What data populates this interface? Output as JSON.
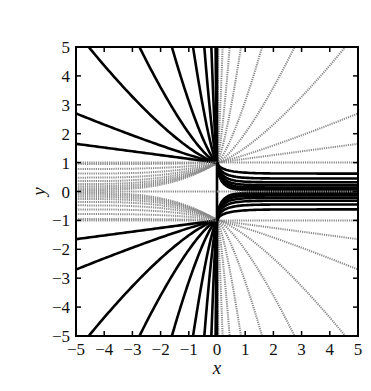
{
  "chart_data": {
    "type": "line",
    "title": "",
    "xlabel": "x",
    "ylabel": "y",
    "xlim": [
      -5,
      5
    ],
    "ylim": [
      -5,
      5
    ],
    "grid": false,
    "legend": null,
    "x_ticks": [
      "−5",
      "−4",
      "−3",
      "−2",
      "−1",
      "0",
      "1",
      "2",
      "3",
      "4",
      "5"
    ],
    "y_ticks": [
      "5",
      "4",
      "3",
      "2",
      "1",
      "0",
      "−1",
      "−2",
      "−3",
      "−4",
      "−5"
    ],
    "x_tick_values": [
      -5,
      -4,
      -3,
      -2,
      -1,
      0,
      1,
      2,
      3,
      4,
      5
    ],
    "y_tick_values": [
      5,
      4,
      3,
      2,
      1,
      0,
      -1,
      -2,
      -3,
      -4,
      -5
    ],
    "styles": {
      "solid": {
        "color": "#000000",
        "width": 2.6
      },
      "dotted": {
        "color": "#8a8a8a",
        "width": 2.0,
        "dash": "1.2 1.0"
      }
    },
    "series": [
      {
        "name": "upper-left fan (solid)",
        "style": "solid",
        "anchor": [
          0,
          1
        ],
        "side": "left",
        "dir": 1,
        "end_points": [
          [
            -5,
            1.65
          ],
          [
            -5,
            2.7
          ],
          [
            -4.55,
            5
          ],
          [
            -2.75,
            5
          ],
          [
            -1.6,
            5
          ],
          [
            -0.85,
            5
          ],
          [
            -0.45,
            5
          ],
          [
            -0.2,
            5
          ],
          [
            -0.05,
            5
          ]
        ]
      },
      {
        "name": "lower-left fan (solid)",
        "style": "solid",
        "anchor": [
          0,
          -1
        ],
        "side": "left",
        "dir": -1,
        "end_points": [
          [
            -5,
            -1.65
          ],
          [
            -5,
            -2.7
          ],
          [
            -4.55,
            -5
          ],
          [
            -2.75,
            -5
          ],
          [
            -1.6,
            -5
          ],
          [
            -0.85,
            -5
          ],
          [
            -0.45,
            -5
          ],
          [
            -0.2,
            -5
          ],
          [
            -0.05,
            -5
          ]
        ]
      },
      {
        "name": "upper-right fan (dotted)",
        "style": "dotted",
        "anchor": [
          0,
          1
        ],
        "side": "right",
        "dir": 1,
        "end_points": [
          [
            5,
            1.0
          ],
          [
            5,
            1.65
          ],
          [
            5,
            2.7
          ],
          [
            4.55,
            5
          ],
          [
            2.75,
            5
          ],
          [
            1.6,
            5
          ],
          [
            0.85,
            5
          ],
          [
            0.45,
            5
          ],
          [
            0.2,
            5
          ],
          [
            0.05,
            5
          ]
        ]
      },
      {
        "name": "lower-right fan (dotted)",
        "style": "dotted",
        "anchor": [
          0,
          -1
        ],
        "side": "right",
        "dir": -1,
        "end_points": [
          [
            5,
            -1.0
          ],
          [
            5,
            -1.65
          ],
          [
            5,
            -2.7
          ],
          [
            4.55,
            -5
          ],
          [
            2.75,
            -5
          ],
          [
            1.6,
            -5
          ],
          [
            0.85,
            -5
          ],
          [
            0.45,
            -5
          ],
          [
            0.2,
            -5
          ],
          [
            0.05,
            -5
          ]
        ]
      },
      {
        "name": "right strip from (0,1) (solid)",
        "style": "solid",
        "anchor": [
          0,
          1
        ],
        "side": "right-strip",
        "end_y": [
          0.62,
          0.45,
          0.32,
          0.22,
          0.14,
          0.08,
          0.04
        ]
      },
      {
        "name": "right strip from (0,-1) (solid)",
        "style": "solid",
        "anchor": [
          0,
          -1
        ],
        "side": "right-strip",
        "end_y": [
          -0.62,
          -0.45,
          -0.32,
          -0.22,
          -0.14,
          -0.08,
          -0.04
        ]
      },
      {
        "name": "left strip (dotted)",
        "style": "dotted",
        "side": "left-strip",
        "start_y": [
          0.95,
          0.78,
          0.62,
          0.48,
          0.36,
          0.26,
          0.18,
          0.11,
          0.05,
          -0.05,
          -0.11,
          -0.18,
          -0.26,
          -0.36,
          -0.48,
          -0.62,
          -0.78,
          -0.95
        ]
      },
      {
        "name": "vertical axis line x=0 (solid)",
        "style": "solid",
        "x": 0,
        "y_range": [
          -5,
          5
        ]
      }
    ]
  },
  "figure": {
    "frame": {
      "left": 76,
      "top": 47,
      "right": 358,
      "bottom": 336
    }
  }
}
